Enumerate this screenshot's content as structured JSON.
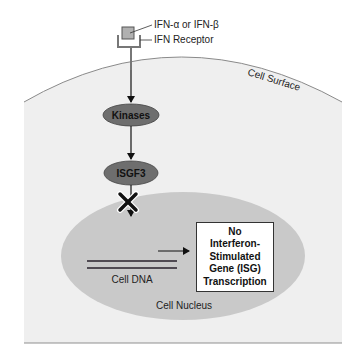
{
  "diagram": {
    "ligand_label": "IFN-α or IFN-β",
    "receptor_label": "IFN Receptor",
    "cell_surface_label": "Cell Surface",
    "kinases_label": "Kinases",
    "isgf3_label": "ISGF3",
    "dna_label": "Cell DNA",
    "nucleus_label": "Cell Nucleus",
    "outcome_box": {
      "lines": [
        "No",
        "Interferon-",
        "Stimulated",
        "Gene (ISG)",
        "Transcription"
      ]
    },
    "blocked_symbol": "X",
    "colors": {
      "cell_fill": "#efefef",
      "cell_outline": "#8a8a8a",
      "nucleus_fill": "#c9c9c9",
      "node_fill": "#6e6e6e",
      "dna_strand": "#4f4a52",
      "ligand_fill": "#b0b0b0"
    }
  }
}
